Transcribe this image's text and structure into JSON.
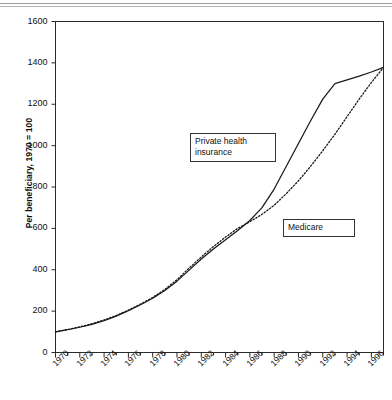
{
  "chart_data": {
    "type": "line",
    "title": "",
    "xlabel": "",
    "ylabel": "Per beneficiary, 1970 = 100",
    "xlim": [
      1970,
      1997
    ],
    "ylim": [
      0,
      1600
    ],
    "ytick_labels": [
      "0",
      "200",
      "400",
      "600",
      "800",
      "1000",
      "1200",
      "1400",
      "1600"
    ],
    "ytick_values": [
      0,
      200,
      400,
      600,
      800,
      1000,
      1200,
      1400,
      1600
    ],
    "xtick_labels": [
      "1970",
      "1972",
      "1974",
      "1976",
      "1978",
      "1980",
      "1982",
      "1984",
      "1986",
      "1988",
      "1990",
      "1992",
      "1994",
      "1996"
    ],
    "xtick_values": [
      1970,
      1972,
      1974,
      1976,
      1978,
      1980,
      1982,
      1984,
      1986,
      1988,
      1990,
      1992,
      1994,
      1996
    ],
    "minor_xticks_every": 1,
    "grid": false,
    "legend_position": "inline-callouts",
    "x": [
      1970,
      1971,
      1972,
      1973,
      1974,
      1975,
      1976,
      1977,
      1978,
      1979,
      1980,
      1981,
      1982,
      1983,
      1984,
      1985,
      1986,
      1987,
      1988,
      1989,
      1990,
      1991,
      1992,
      1993,
      1994,
      1995,
      1996,
      1997
    ],
    "series": [
      {
        "name": "Private health insurance",
        "style": "solid",
        "color": "#1a1a1a",
        "values": [
          100,
          110,
          122,
          136,
          154,
          176,
          202,
          231,
          262,
          300,
          345,
          398,
          452,
          500,
          545,
          590,
          638,
          700,
          790,
          900,
          1010,
          1120,
          1225,
          1300,
          1318,
          1336,
          1356,
          1378
        ]
      },
      {
        "name": "Medicare",
        "style": "dotted",
        "color": "#1a1a1a",
        "values": [
          100,
          111,
          124,
          139,
          157,
          179,
          205,
          234,
          266,
          305,
          352,
          408,
          462,
          512,
          558,
          600,
          632,
          668,
          712,
          768,
          830,
          900,
          975,
          1055,
          1140,
          1225,
          1305,
          1378
        ]
      }
    ],
    "annotations": [
      {
        "id": "private",
        "label_lines": [
          "Private health",
          "insurance"
        ],
        "box": true
      },
      {
        "id": "medicare",
        "label_lines": [
          "Medicare"
        ],
        "box": true
      }
    ]
  }
}
